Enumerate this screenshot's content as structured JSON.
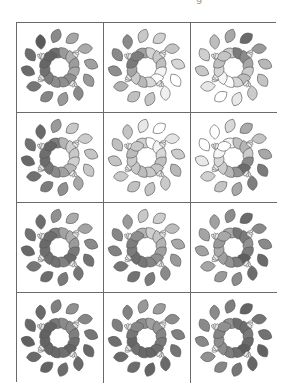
{
  "page": {
    "top_fragment": "g"
  },
  "grid": {
    "rows": 4,
    "cols": 3,
    "line_color": "#6a6a6a",
    "leaf_stroke": "#555555",
    "bud_fill": "#e8e8e8",
    "cells": [
      {
        "name": "wreath-r1c1",
        "shades": [
          "#5a5a5a",
          "#6e6e6e",
          "#8a8a8a",
          "#9a9a9a",
          "#a6a6a6",
          "#b0b0b0",
          "#aaaaaa",
          "#9c9c9c",
          "#a0a0a0",
          "#a8a8a8",
          "#9a9a9a",
          "#8e8e8e",
          "#8a8a8a",
          "#8e8e8e",
          "#9a9a9a",
          "#8c8c8c",
          "#858585",
          "#7e7e7e",
          "#767676",
          "#707070",
          "#6a6a6a",
          "#666666",
          "#6e6e6e",
          "#626262"
        ]
      },
      {
        "name": "wreath-r1c2",
        "shades": [
          "#8a8a8a",
          "#a0a0a0",
          "#c8c8c8",
          "#d4d4d4",
          "#d0d0d0",
          "#c8c8c8",
          "#c4c4c4",
          "#c0c0c0",
          "#d6d6d6",
          "#f4f4f4",
          "#ffffff",
          "#ffffff",
          "#f0f0f0",
          "#d8d8d8",
          "#c6c6c6",
          "#b8b8b8",
          "#c0c0c0",
          "#cacaca",
          "#b2b2b2",
          "#a4a4a4",
          "#8e8e8e",
          "#7a7a7a",
          "#8a8a8a",
          "#7c7c7c"
        ]
      },
      {
        "name": "wreath-r1c3",
        "shades": [
          "#bdbdbd",
          "#c8c8c8",
          "#a8a8a8",
          "#7a7a7a",
          "#6a6a6a",
          "#8a8a8a",
          "#9a9a9a",
          "#a8a8a8",
          "#b8b8b8",
          "#cccccc",
          "#c4c4c4",
          "#bcbcbc",
          "#cacaca",
          "#d6d6d6",
          "#e8e8e8",
          "#ffffff",
          "#ffffff",
          "#f6f6f6",
          "#e6e6e6",
          "#d6d6d6",
          "#c8c8c8",
          "#c0c0c0",
          "#cfcfcf",
          "#c4c4c4"
        ]
      },
      {
        "name": "wreath-r2c1",
        "shades": [
          "#6a6a6a",
          "#7c7c7c",
          "#9a9a9a",
          "#b4b4b4",
          "#c8c8c8",
          "#d0d0d0",
          "#cccccc",
          "#c8c8c8",
          "#c4c4c4",
          "#d0d0d0",
          "#c8c8c8",
          "#b8b8b8",
          "#a8a8a8",
          "#a0a0a0",
          "#909090",
          "#8a8a8a",
          "#7c7c7c",
          "#767676",
          "#707070",
          "#6c6c6c",
          "#686868",
          "#6e6e6e",
          "#727272",
          "#666666"
        ]
      },
      {
        "name": "wreath-r2c2",
        "shades": [
          "#c4c4c4",
          "#d0d0d0",
          "#e8e8e8",
          "#ffffff",
          "#ffffff",
          "#f2f2f2",
          "#e4e4e4",
          "#d8d8d8",
          "#cccccc",
          "#c0c0c0",
          "#b8b8b8",
          "#c4c4c4",
          "#cacaca",
          "#c8c8c8",
          "#c4c4c4",
          "#bcbcbc",
          "#c0c0c0",
          "#c6c6c6",
          "#cacaca",
          "#c8c8c8",
          "#c4c4c4",
          "#bcbcbc",
          "#c0c0c0",
          "#c8c8c8"
        ]
      },
      {
        "name": "wreath-r2c3",
        "shades": [
          "#ffffff",
          "#f4f4f4",
          "#d8d8d8",
          "#c0c0c0",
          "#aaaaaa",
          "#b4b4b4",
          "#c4c4c4",
          "#cccccc",
          "#a8a8a8",
          "#8a8a8a",
          "#7a7a7a",
          "#6c6c6c",
          "#7e7e7e",
          "#949494",
          "#a8a8a8",
          "#b8b8b8",
          "#c4c4c4",
          "#cccccc",
          "#d0d0d0",
          "#d8d8d8",
          "#e8e8e8",
          "#f6f6f6",
          "#ffffff",
          "#ffffff"
        ]
      },
      {
        "name": "wreath-r3c1",
        "shades": [
          "#6e6e6e",
          "#7e7e7e",
          "#909090",
          "#a2a2a2",
          "#aaaaaa",
          "#b0b0b0",
          "#a4a4a4",
          "#9a9a9a",
          "#8a8a8a",
          "#7a7a7a",
          "#727272",
          "#6c6c6c",
          "#767676",
          "#808080",
          "#7a7a7a",
          "#727272",
          "#6c6c6c",
          "#707070",
          "#767676",
          "#6e6e6e",
          "#686868",
          "#6a6a6a",
          "#727272",
          "#6c6c6c"
        ]
      },
      {
        "name": "wreath-r3c2",
        "shades": [
          "#9a9a9a",
          "#b4b4b4",
          "#c8c8c8",
          "#d0d0d0",
          "#cccccc",
          "#c4c4c4",
          "#bcbcbc",
          "#b4b4b4",
          "#a8a8a8",
          "#a0a0a0",
          "#9a9a9a",
          "#909090",
          "#8a8a8a",
          "#848484",
          "#7c7c7c",
          "#767676",
          "#727272",
          "#6e6e6e",
          "#767676",
          "#7c7c7c",
          "#828282",
          "#7e7e7e",
          "#868686",
          "#8e8e8e"
        ]
      },
      {
        "name": "wreath-r3c3",
        "shades": [
          "#a0a0a0",
          "#a8a8a8",
          "#8c8c8c",
          "#767676",
          "#6a6a6a",
          "#7a7a7a",
          "#8a8a8a",
          "#929292",
          "#8a8a8a",
          "#7c7c7c",
          "#6a6a6a",
          "#5e5e5e",
          "#6c6c6c",
          "#7e7e7e",
          "#8c8c8c",
          "#949494",
          "#9a9a9a",
          "#a0a0a0",
          "#a6a6a6",
          "#aaaaaa",
          "#a2a2a2",
          "#9a9a9a",
          "#a4a4a4",
          "#a8a8a8"
        ]
      },
      {
        "name": "wreath-r4c1",
        "shades": [
          "#6a6a6a",
          "#787878",
          "#808080",
          "#8a8a8a",
          "#909090",
          "#8c8c8c",
          "#868686",
          "#7e7e7e",
          "#767676",
          "#6e6e6e",
          "#686868",
          "#646464",
          "#6a6a6a",
          "#707070",
          "#6c6c6c",
          "#686868",
          "#646464",
          "#666666",
          "#6a6a6a",
          "#646464",
          "#606060",
          "#626262",
          "#686868",
          "#646464"
        ]
      },
      {
        "name": "wreath-r4c2",
        "shades": [
          "#828282",
          "#8e8e8e",
          "#989898",
          "#a0a0a0",
          "#9c9c9c",
          "#949494",
          "#8c8c8c",
          "#868686",
          "#808080",
          "#7a7a7a",
          "#747474",
          "#6e6e6e",
          "#6a6a6a",
          "#666666",
          "#646464",
          "#686868",
          "#6c6c6c",
          "#707070",
          "#6a6a6a",
          "#666666",
          "#6e6e6e",
          "#767676",
          "#7e7e7e",
          "#868686"
        ]
      },
      {
        "name": "wreath-r4c3",
        "shades": [
          "#8a8a8a",
          "#929292",
          "#7e7e7e",
          "#6e6e6e",
          "#646464",
          "#6c6c6c",
          "#747474",
          "#7a7a7a",
          "#727272",
          "#6a6a6a",
          "#626262",
          "#5e5e5e",
          "#666666",
          "#6e6e6e",
          "#767676",
          "#7e7e7e",
          "#868686",
          "#8c8c8c",
          "#929292",
          "#8e8e8e",
          "#888888",
          "#848484",
          "#8a8a8a",
          "#909090"
        ]
      }
    ]
  }
}
